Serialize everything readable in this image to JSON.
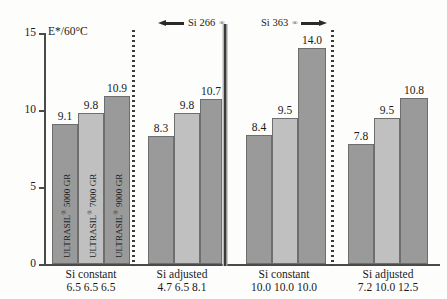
{
  "chart_data": {
    "type": "bar",
    "title": "",
    "xlabel": "",
    "ylabel": "E*/60°C",
    "ylim": [
      0,
      15
    ],
    "yticks": [
      0,
      5,
      10,
      15
    ],
    "ytick_labels": [
      "0",
      "5",
      "10",
      "15"
    ],
    "grid": false,
    "legend": "none",
    "bar_labels": [
      "ULTRASIL® 5000 GR",
      "ULTRASIL® 7000 GR",
      "ULTRASIL® 9000 GR"
    ],
    "groups": [
      {
        "caption": "Si constant",
        "silane_values": "6.5  6.5  6.5",
        "silane_list": [
          "6.5",
          "6.5",
          "6.5"
        ],
        "values": [
          9.1,
          9.8,
          10.9
        ],
        "value_labels": [
          "9.1",
          "9.8",
          "10.9"
        ],
        "categories": [
          "ULTRASIL® 5000 GR",
          "ULTRASIL® 7000 GR",
          "ULTRASIL® 9000 GR"
        ]
      },
      {
        "caption": "Si adjusted",
        "silane_values": "4.7  6.5  8.1",
        "silane_list": [
          "4.7",
          "6.5",
          "8.1"
        ],
        "values": [
          8.3,
          9.8,
          10.7
        ],
        "value_labels": [
          "8.3",
          "9.8",
          "10.7"
        ],
        "categories": [
          "ULTRASIL® 5000 GR",
          "ULTRASIL® 7000 GR",
          "ULTRASIL® 9000 GR"
        ]
      },
      {
        "caption": "Si constant",
        "silane_values": "10.0 10.0 10.0",
        "silane_list": [
          "10.0",
          "10.0",
          "10.0"
        ],
        "values": [
          8.4,
          9.5,
          14.0
        ],
        "value_labels": [
          "8.4",
          "9.5",
          "14.0"
        ],
        "categories": [
          "ULTRASIL® 5000 GR",
          "ULTRASIL® 7000 GR",
          "ULTRASIL® 9000 GR"
        ]
      },
      {
        "caption": "Si adjusted",
        "silane_values": "7.2  10.0 12.5",
        "silane_list": [
          "7.2",
          "10.0",
          "12.5"
        ],
        "values": [
          7.8,
          9.5,
          10.8
        ],
        "value_labels": [
          "7.8",
          "9.5",
          "10.8"
        ],
        "categories": [
          "ULTRASIL® 5000 GR",
          "ULTRASIL® 7000 GR",
          "ULTRASIL® 9000 GR"
        ]
      }
    ],
    "annotations": [
      {
        "text": "Si 266",
        "superscript": "®",
        "arrow": "left",
        "spans_groups": [
          0,
          1
        ]
      },
      {
        "text": "Si 363",
        "superscript": "®",
        "arrow": "right",
        "spans_groups": [
          2,
          3
        ]
      }
    ],
    "colors": {
      "bar_dark": "#9a9a9a",
      "bar_light": "#c0c0c0",
      "bar_border": "#6e6e6e",
      "axis": "#4a4a4a",
      "text": "#1a1a1a",
      "background": "#fdfdfc"
    }
  }
}
